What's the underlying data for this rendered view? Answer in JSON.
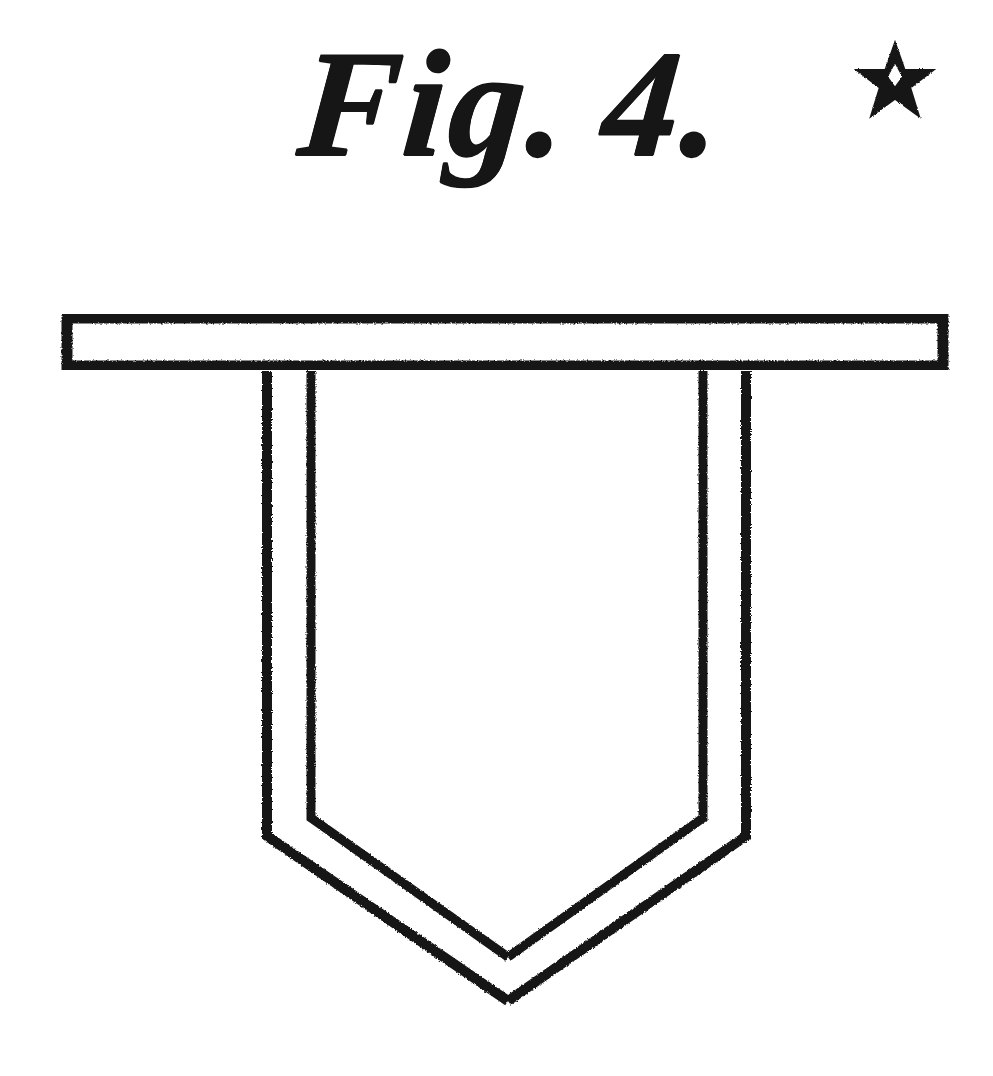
{
  "plate": {
    "width": 993,
    "height": 1076,
    "background_color": "#ffffff",
    "ink_color": "#161616",
    "medium": "engraving"
  },
  "caption": {
    "figure_word": "Fig.",
    "figure_number": "4.",
    "full_text": "Fig. 4.",
    "ornament": "five-pointed-star",
    "ornament_glyph": "☆",
    "style": "italic-script-serif"
  },
  "figure": {
    "parts": [
      {
        "name": "top-bar",
        "shape": "rectangle-outline",
        "x": 62,
        "y": 313,
        "width": 886,
        "height": 58,
        "stroke": 11
      },
      {
        "name": "shield-outer-outline",
        "shape": "pentagon-pointed-down",
        "left_x": 267,
        "right_x": 746,
        "top_y": 371,
        "shoulder_y": 836,
        "apex_x": 508,
        "apex_y": 1001,
        "stroke": 10
      },
      {
        "name": "shield-inner-outline",
        "shape": "pentagon-pointed-down",
        "left_x": 311,
        "right_x": 703,
        "top_y": 371,
        "shoulder_y": 818,
        "apex_x": 508,
        "apex_y": 957,
        "stroke": 9
      }
    ]
  },
  "chart_data": {
    "type": "line",
    "xlabel": "",
    "ylabel": "",
    "xlim": [
      0,
      993
    ],
    "ylim": [
      0,
      1076
    ],
    "grid": false,
    "legend": "none",
    "annotations": [
      "Fig. 4.",
      "★"
    ],
    "series": [
      {
        "name": "top-bar-outer",
        "closed": true,
        "x": [
          62,
          948,
          948,
          62
        ],
        "y": [
          313,
          313,
          371,
          371
        ]
      },
      {
        "name": "shield-outer",
        "closed": false,
        "x": [
          267,
          267,
          508,
          746,
          746
        ],
        "y": [
          371,
          836,
          1001,
          836,
          371
        ]
      },
      {
        "name": "shield-inner",
        "closed": false,
        "x": [
          311,
          311,
          508,
          703,
          703
        ],
        "y": [
          371,
          818,
          957,
          818,
          371
        ]
      }
    ]
  }
}
